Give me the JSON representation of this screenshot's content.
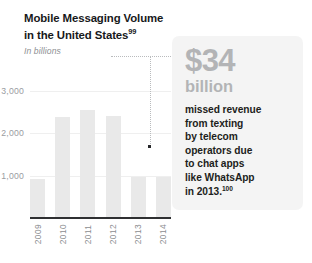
{
  "header": {
    "title_line1": "Mobile Messaging Volume",
    "title_line2": "in the United States",
    "title_footnote": "99",
    "subtitle": "In billions"
  },
  "callout": {
    "amount": "$34",
    "unit": "billion",
    "body_lines": [
      "missed revenue",
      "from texting",
      "by telecom",
      "operators due",
      "to chat apps",
      "like WhatsApp",
      "in 2013."
    ],
    "body_footnote": "100",
    "amount_color": "#b3b4b6",
    "background_color": "#f4f4f4",
    "body_color": "#1d1e20"
  },
  "chart_data": {
    "type": "bar",
    "title": "Mobile Messaging Volume in the United States",
    "subtitle": "In billions",
    "xlabel": "",
    "ylabel": "In billions",
    "categories": [
      "2009",
      "2010",
      "2011",
      "2012",
      "2013",
      "2014"
    ],
    "values": [
      950,
      2400,
      2560,
      2420,
      1000,
      1000
    ],
    "ylim": [
      0,
      3200
    ],
    "yticks": [
      1000,
      2000,
      3000
    ],
    "ytick_labels": [
      "1,000",
      "2,000",
      "3,000"
    ],
    "grid": true,
    "legend": false,
    "bar_color": "#e9e9e9",
    "axis_color": "#2f3032",
    "annotations": [
      {
        "label": "$34 billion",
        "attached_to_category": "2013",
        "marker_value": 1420
      }
    ]
  }
}
